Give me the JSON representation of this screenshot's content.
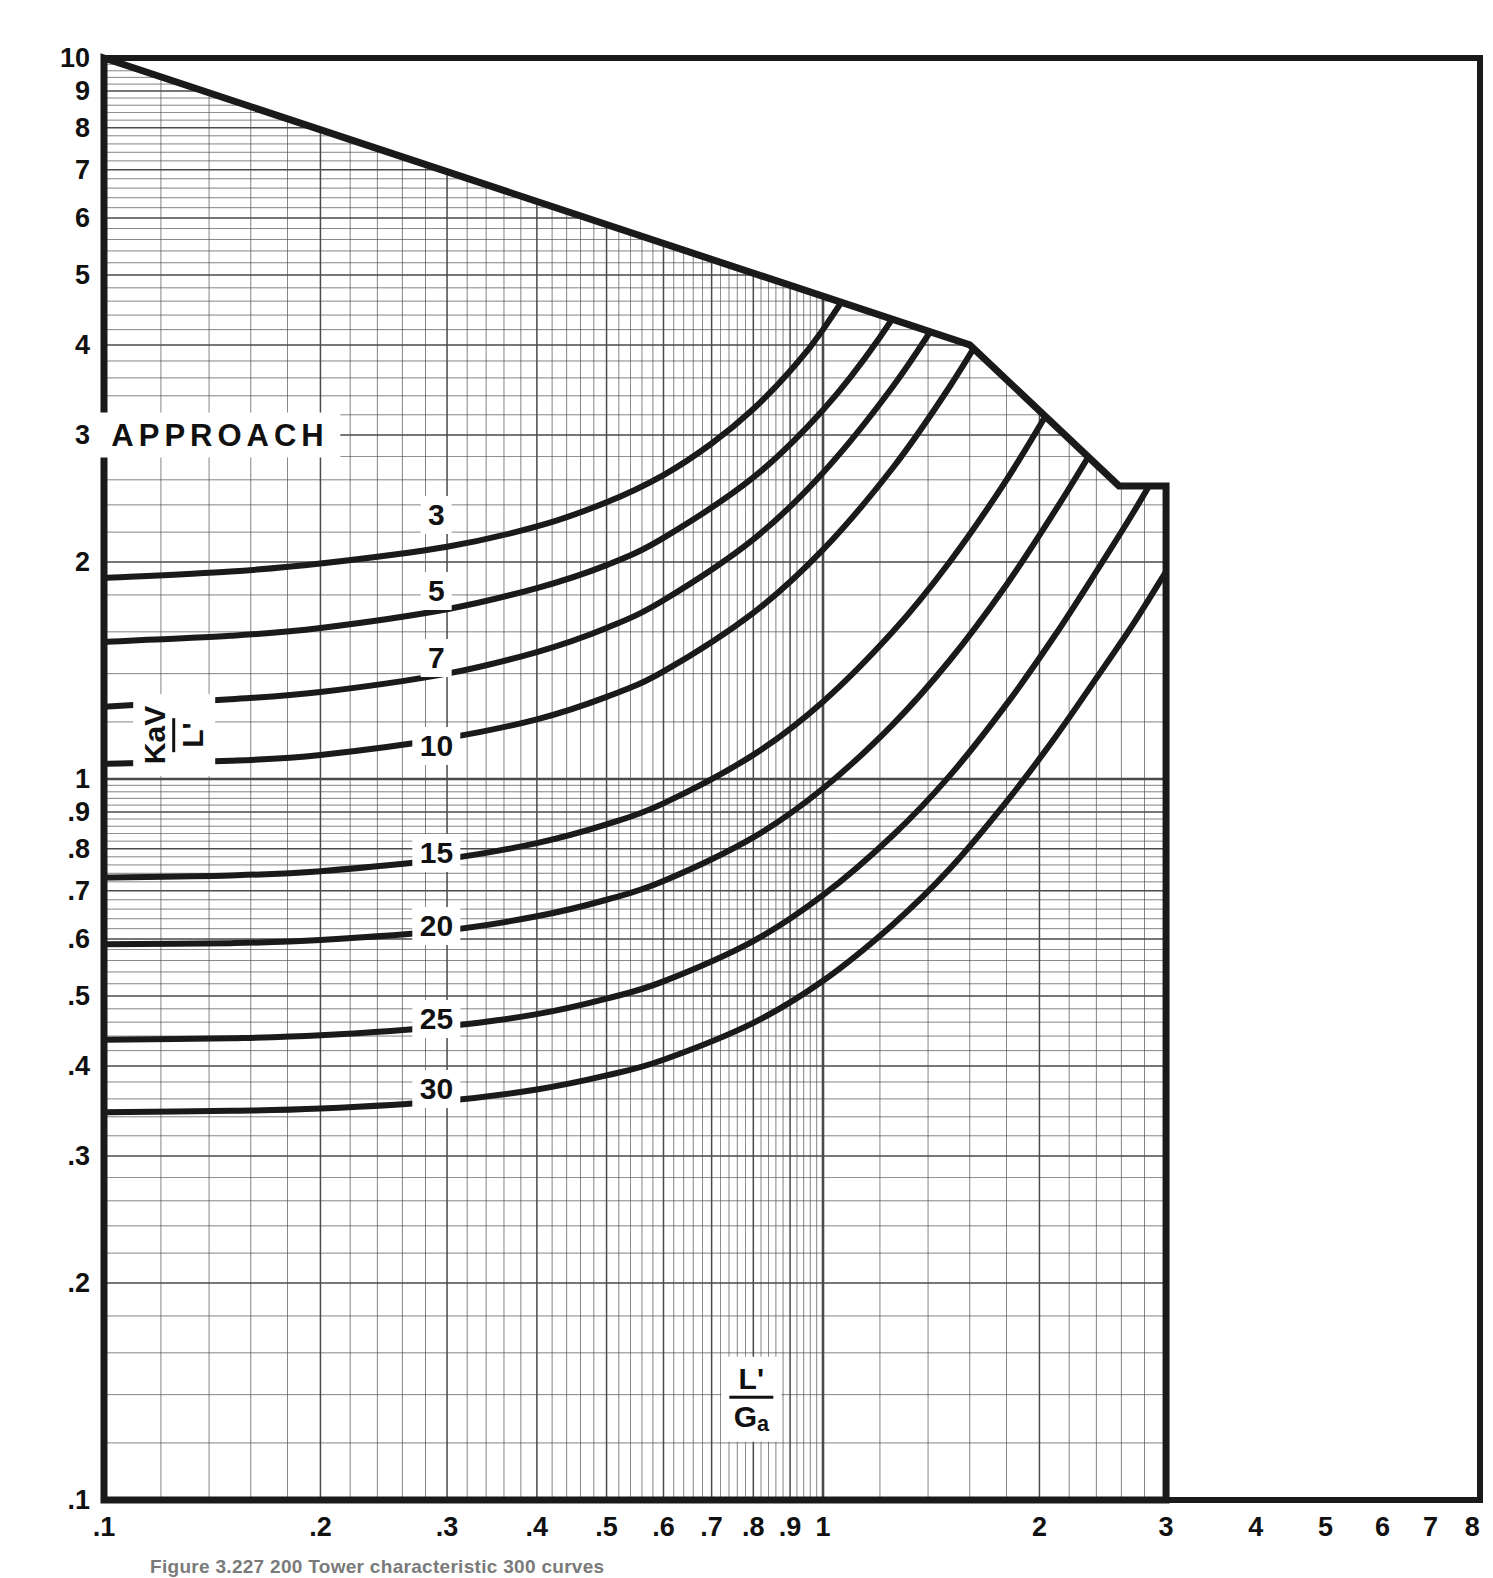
{
  "figure": {
    "caption": "Figure 3.227  200 Tower characteristic 300 curves",
    "background_color": "#ffffff",
    "ink_color": "#1a1a1a",
    "grid_color": "#4a4a4a"
  },
  "axes": {
    "x_label_numerator": "L'",
    "x_label_denominator_main": "G",
    "x_label_denominator_sub": "a",
    "y_label_numerator": "KaV",
    "y_label_denominator": "L'",
    "x_ticks": [
      ".1",
      ".2",
      ".3",
      ".4",
      ".5",
      ".6",
      ".7",
      ".8",
      ".9",
      "1",
      "2",
      "3",
      "4",
      "5",
      "6",
      "7",
      "8"
    ],
    "y_ticks": [
      "10",
      "9",
      "8",
      "7",
      "6",
      "5",
      "4",
      "3",
      "2",
      "1",
      ".9",
      ".8",
      ".7",
      ".6",
      ".5",
      ".4",
      ".3",
      ".2",
      ".1"
    ],
    "x_min": 0.1,
    "x_max": 8,
    "y_min": 0.1,
    "y_max": 10,
    "x_grid_max": 3,
    "scale": "log-log",
    "grid": "on"
  },
  "legend": {
    "title": "APPROACH",
    "title_position": {
      "x": 0.145,
      "y": 3.0
    }
  },
  "chart_data": {
    "type": "line",
    "xlabel": "L'/Ga",
    "ylabel": "KaV/L'",
    "xlim": [
      0.1,
      8
    ],
    "ylim": [
      0.1,
      10
    ],
    "xscale": "log",
    "yscale": "log",
    "grid": "on",
    "legend_position": "in-plot-labels",
    "legend_title": "APPROACH",
    "series": [
      {
        "name": "3",
        "label": "3",
        "label_at": {
          "x": 0.29,
          "y": 2.32
        },
        "x": [
          0.1,
          0.15,
          0.2,
          0.3,
          0.4,
          0.5,
          0.6,
          0.7,
          0.8,
          0.9,
          1.0,
          1.2,
          1.4,
          1.6
        ],
        "y": [
          1.9,
          1.94,
          1.99,
          2.1,
          2.24,
          2.42,
          2.64,
          2.92,
          3.26,
          3.68,
          4.2,
          5.6,
          7.6,
          10.0
        ]
      },
      {
        "name": "5",
        "label": "5",
        "label_at": {
          "x": 0.29,
          "y": 1.82
        },
        "x": [
          0.1,
          0.15,
          0.2,
          0.3,
          0.4,
          0.5,
          0.6,
          0.8,
          1.0,
          1.2,
          1.4,
          1.6,
          1.8,
          2.0
        ],
        "y": [
          1.55,
          1.58,
          1.62,
          1.72,
          1.84,
          1.98,
          2.16,
          2.62,
          3.25,
          4.1,
          5.25,
          6.8,
          8.7,
          10.0
        ]
      },
      {
        "name": "7",
        "label": "7",
        "label_at": {
          "x": 0.29,
          "y": 1.47
        },
        "x": [
          0.1,
          0.15,
          0.2,
          0.3,
          0.4,
          0.5,
          0.6,
          0.8,
          1.0,
          1.25,
          1.5,
          1.75,
          2.0,
          2.2
        ],
        "y": [
          1.26,
          1.29,
          1.32,
          1.4,
          1.5,
          1.62,
          1.77,
          2.15,
          2.66,
          3.5,
          4.6,
          6.0,
          7.7,
          9.3
        ]
      },
      {
        "name": "10",
        "label": "10",
        "label_at": {
          "x": 0.29,
          "y": 1.11
        },
        "x": [
          0.1,
          0.15,
          0.2,
          0.3,
          0.4,
          0.5,
          0.6,
          0.8,
          1.0,
          1.25,
          1.5,
          1.75,
          2.0,
          2.3,
          2.55
        ],
        "y": [
          1.05,
          1.06,
          1.08,
          1.14,
          1.21,
          1.3,
          1.41,
          1.7,
          2.08,
          2.7,
          3.5,
          4.5,
          5.7,
          7.5,
          9.2
        ]
      },
      {
        "name": "15",
        "label": "15",
        "label_at": {
          "x": 0.29,
          "y": 0.79
        },
        "x": [
          0.1,
          0.15,
          0.2,
          0.3,
          0.4,
          0.5,
          0.6,
          0.8,
          1.0,
          1.25,
          1.5,
          1.8,
          2.1,
          2.4,
          2.7,
          3.0
        ],
        "y": [
          0.73,
          0.735,
          0.745,
          0.775,
          0.815,
          0.865,
          0.925,
          1.08,
          1.28,
          1.6,
          2.0,
          2.6,
          3.35,
          4.25,
          5.3,
          6.5
        ]
      },
      {
        "name": "20",
        "label": "20",
        "label_at": {
          "x": 0.29,
          "y": 0.625
        },
        "x": [
          0.1,
          0.15,
          0.2,
          0.3,
          0.4,
          0.5,
          0.6,
          0.8,
          1.0,
          1.25,
          1.5,
          1.8,
          2.1,
          2.4,
          2.7,
          3.0
        ],
        "y": [
          0.59,
          0.592,
          0.598,
          0.617,
          0.645,
          0.68,
          0.722,
          0.83,
          0.97,
          1.19,
          1.46,
          1.86,
          2.35,
          2.92,
          3.58,
          4.3
        ]
      },
      {
        "name": "25",
        "label": "25",
        "label_at": {
          "x": 0.29,
          "y": 0.465
        },
        "x": [
          0.1,
          0.15,
          0.2,
          0.3,
          0.4,
          0.5,
          0.6,
          0.8,
          1.0,
          1.25,
          1.5,
          1.8,
          2.1,
          2.4,
          2.7,
          3.0
        ],
        "y": [
          0.435,
          0.437,
          0.441,
          0.454,
          0.472,
          0.496,
          0.524,
          0.596,
          0.69,
          0.835,
          1.01,
          1.27,
          1.58,
          1.94,
          2.34,
          2.8
        ]
      },
      {
        "name": "30",
        "label": "30",
        "label_at": {
          "x": 0.29,
          "y": 0.372
        },
        "x": [
          0.1,
          0.15,
          0.2,
          0.3,
          0.4,
          0.5,
          0.6,
          0.8,
          1.0,
          1.25,
          1.5,
          1.8,
          2.1,
          2.4,
          2.7,
          3.0
        ],
        "y": [
          0.345,
          0.3465,
          0.349,
          0.358,
          0.371,
          0.388,
          0.408,
          0.459,
          0.525,
          0.628,
          0.75,
          0.93,
          1.14,
          1.38,
          1.64,
          1.94
        ]
      }
    ],
    "boundary": {
      "name": "saturation-boundary",
      "description": "upper-left straight cut-off and right vertical edge of the plotting field",
      "points": [
        {
          "x": 0.1,
          "y": 10.0
        },
        {
          "x": 1.6,
          "y": 4.0
        },
        {
          "x": 2.58,
          "y": 2.55
        },
        {
          "x": 3.0,
          "y": 2.55
        }
      ]
    }
  }
}
